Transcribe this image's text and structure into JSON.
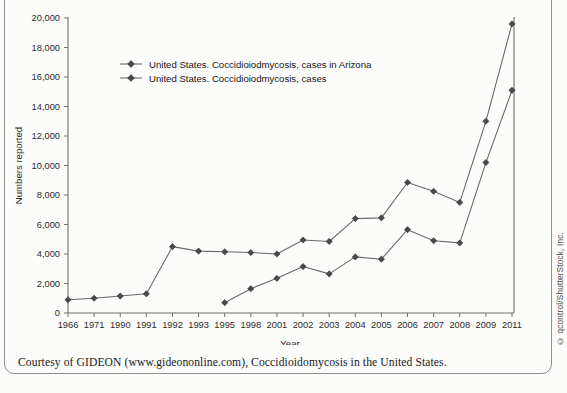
{
  "figure": {
    "caption": "Courtesy of GIDEON (www.gideononline.com), Coccidioidomycosis in the United States.",
    "credit": "© qcontrol/ShutterStock, Inc."
  },
  "chart_data": {
    "type": "line",
    "title": "",
    "xlabel": "Year",
    "ylabel": "Numbers reported",
    "categories": [
      "1966",
      "1971",
      "1990",
      "1991",
      "1992",
      "1993",
      "1995",
      "1998",
      "2001",
      "2002",
      "2003",
      "2004",
      "2005",
      "2006",
      "2007",
      "2008",
      "2009",
      "2011"
    ],
    "xtick_labels": [
      "1966",
      "1971",
      "1990",
      "1991",
      "1992",
      "1993",
      "1995",
      "1998",
      "2001",
      "2002",
      "2003",
      "2004",
      "2005",
      "2006",
      "2007",
      "2008",
      "2009",
      "2011"
    ],
    "ytick_labels": [
      "0",
      "2,000",
      "4,000",
      "6,000",
      "8,000",
      "10,000",
      "12,000",
      "14,000",
      "16,000",
      "18,000",
      "20,000"
    ],
    "ytick_values": [
      0,
      2000,
      4000,
      6000,
      8000,
      10000,
      12000,
      14000,
      16000,
      18000,
      20000
    ],
    "ylim": [
      0,
      20000
    ],
    "grid": false,
    "legend_position": "upper-left-inside",
    "series": [
      {
        "name": "United States. Coccidioiodmycosis, cases in Arizona",
        "marker": "diamond",
        "color": "#6b6b6b",
        "x": [
          "1995",
          "1998",
          "2001",
          "2002",
          "2003",
          "2004",
          "2005",
          "2006",
          "2007",
          "2008",
          "2009",
          "2011"
        ],
        "values": [
          700,
          1650,
          2350,
          3150,
          2650,
          3800,
          3650,
          5650,
          4900,
          4750,
          10200,
          15100
        ]
      },
      {
        "name": "United States. Coccidioiodmycosis, cases",
        "marker": "diamond",
        "color": "#6b6b6b",
        "x": [
          "1966",
          "1971",
          "1990",
          "1991",
          "1992",
          "1993",
          "1995",
          "1998",
          "2001",
          "2002",
          "2003",
          "2004",
          "2005",
          "2006",
          "2007",
          "2008",
          "2009",
          "2011"
        ],
        "values": [
          900,
          1000,
          1150,
          1300,
          4500,
          4200,
          4150,
          4100,
          4000,
          4950,
          4850,
          6400,
          6450,
          8850,
          8250,
          7500,
          13000,
          19600
        ]
      }
    ]
  }
}
